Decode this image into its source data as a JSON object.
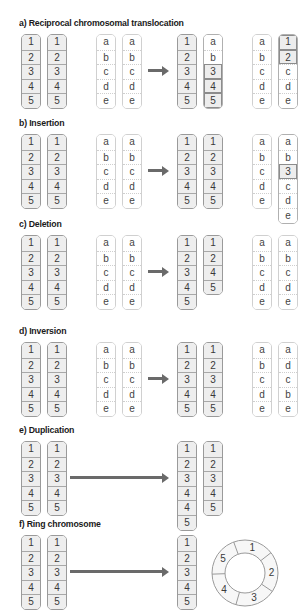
{
  "sections": [
    {
      "id": "a",
      "title": "a) Reciprocal chromosomal translocation",
      "before": {
        "numbered": [
          [
            "1",
            "2",
            "3",
            "4",
            "5"
          ],
          [
            "1",
            "2",
            "3",
            "4",
            "5"
          ]
        ],
        "lettered": [
          [
            "a",
            "b",
            "c",
            "d",
            "e"
          ],
          [
            "a",
            "b",
            "c",
            "d",
            "e"
          ]
        ]
      },
      "after": {
        "numbered": [
          [
            "1",
            "2",
            "3",
            "4",
            "5"
          ],
          [
            "a",
            "b",
            "3",
            "4",
            "5"
          ]
        ],
        "lettered": [
          [
            "a",
            "b",
            "c",
            "d",
            "e"
          ],
          [
            "1",
            "2",
            "c",
            "d",
            "e"
          ]
        ]
      }
    },
    {
      "id": "b",
      "title": "b) Insertion",
      "before": {
        "numbered": [
          [
            "1",
            "2",
            "3",
            "4",
            "5"
          ],
          [
            "1",
            "2",
            "3",
            "4",
            "5"
          ]
        ],
        "lettered": [
          [
            "a",
            "b",
            "c",
            "d",
            "e"
          ],
          [
            "a",
            "b",
            "c",
            "d",
            "e"
          ]
        ]
      },
      "after": {
        "numbered": [
          [
            "1",
            "2",
            "3",
            "4",
            "5"
          ],
          [
            "1",
            "2",
            "3",
            "4",
            "5"
          ]
        ],
        "lettered": [
          [
            "a",
            "b",
            "c",
            "d",
            "e"
          ],
          [
            "a",
            "b",
            "3",
            "c",
            "d",
            "e"
          ]
        ]
      }
    },
    {
      "id": "c",
      "title": "c) Deletion",
      "before": {
        "numbered": [
          [
            "1",
            "2",
            "3",
            "4",
            "5"
          ],
          [
            "1",
            "2",
            "3",
            "4",
            "5"
          ]
        ],
        "lettered": [
          [
            "a",
            "b",
            "c",
            "d",
            "e"
          ],
          [
            "a",
            "b",
            "c",
            "d",
            "e"
          ]
        ]
      },
      "after": {
        "numbered": [
          [
            "1",
            "2",
            "3",
            "4",
            "5"
          ],
          [
            "1",
            "2",
            "4",
            "5"
          ]
        ],
        "lettered": [
          [
            "a",
            "b",
            "c",
            "d",
            "e"
          ],
          [
            "a",
            "b",
            "c",
            "d",
            "e"
          ]
        ]
      }
    },
    {
      "id": "d",
      "title": "d) Inversion",
      "before": {
        "numbered": [
          [
            "1",
            "2",
            "3",
            "4",
            "5"
          ],
          [
            "1",
            "2",
            "3",
            "4",
            "5"
          ]
        ],
        "lettered": [
          [
            "a",
            "b",
            "c",
            "d",
            "e"
          ],
          [
            "a",
            "b",
            "c",
            "d",
            "e"
          ]
        ]
      },
      "after": {
        "numbered": [
          [
            "1",
            "2",
            "3",
            "4",
            "5"
          ],
          [
            "1",
            "2",
            "3",
            "4",
            "5"
          ]
        ],
        "lettered": [
          [
            "a",
            "b",
            "c",
            "d",
            "e"
          ],
          [
            "a",
            "d",
            "c",
            "b",
            "e"
          ]
        ]
      }
    },
    {
      "id": "e",
      "title": "e) Duplication",
      "before": {
        "numbered": [
          [
            "1",
            "2",
            "3",
            "4",
            "5"
          ],
          [
            "1",
            "2",
            "3",
            "4",
            "5"
          ]
        ]
      },
      "after": {
        "numbered": [
          [
            "1",
            "2",
            "3",
            "4",
            "4",
            "5"
          ],
          [
            "1",
            "2",
            "3",
            "4",
            "5"
          ]
        ]
      }
    },
    {
      "id": "f",
      "title": "f) Ring chromosome",
      "before": {
        "numbered": [
          [
            "1",
            "2",
            "3",
            "4",
            "5"
          ],
          [
            "1",
            "2",
            "3",
            "4",
            "5"
          ]
        ]
      },
      "after": {
        "numbered": [
          [
            "1",
            "2",
            "3",
            "4",
            "5"
          ]
        ],
        "ring": [
          "1",
          "2",
          "3",
          "4",
          "5"
        ]
      }
    }
  ],
  "colors": {
    "numbered_fill": "#eeeeee",
    "border": "#9a9a9a",
    "arrow": "#6a6a6a"
  }
}
